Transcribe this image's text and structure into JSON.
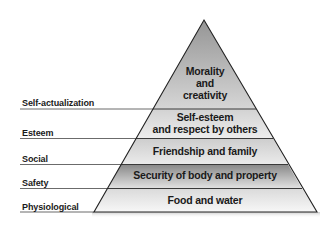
{
  "diagram": {
    "type": "pyramid",
    "levels": [
      {
        "name": "Self-actualization",
        "description_lines": [
          "Morality",
          "and",
          "creativity"
        ]
      },
      {
        "name": "Esteem",
        "description_lines": [
          "Self-esteem",
          "and respect by others"
        ]
      },
      {
        "name": "Social",
        "description_lines": [
          "Friendship and family"
        ]
      },
      {
        "name": "Safety",
        "description_lines": [
          "Security of body and property"
        ]
      },
      {
        "name": "Physiological",
        "description_lines": [
          "Food and water"
        ]
      }
    ],
    "colors": {
      "outline": "#222222",
      "label_line": "#555555",
      "top_gradient": [
        "#969696",
        "#d6d6d6"
      ],
      "esteem_fill": [
        "#cfcfcf",
        "#ececec"
      ],
      "social_fill": [
        "#cfcfcf",
        "#ececec"
      ],
      "safety_gradient": [
        "#8a8a8a",
        "#e0e0e0"
      ],
      "physio_fill": [
        "#dcdcdc",
        "#f6f6f6"
      ]
    }
  }
}
